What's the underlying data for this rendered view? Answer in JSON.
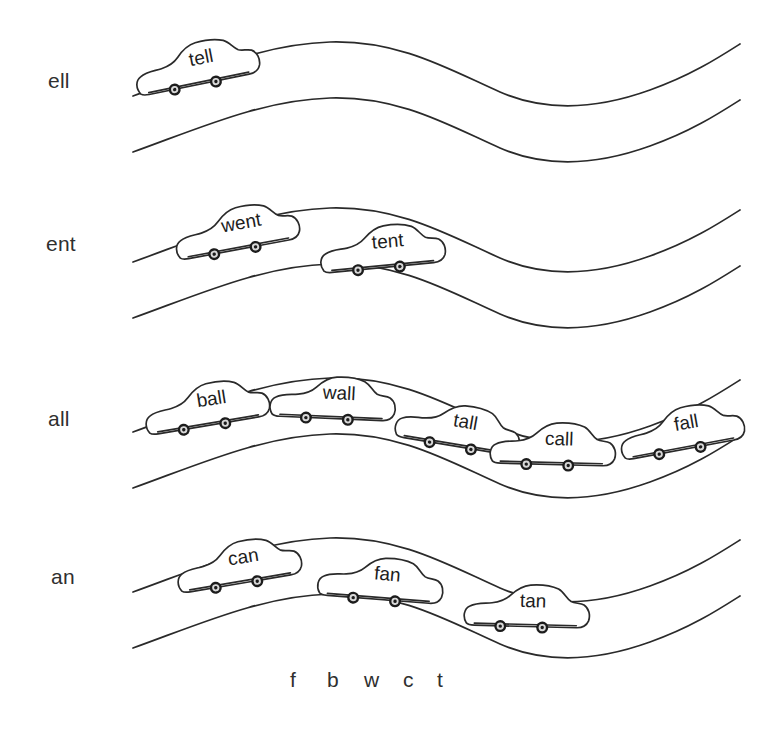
{
  "page": {
    "width": 767,
    "height": 729,
    "background_color": "#ffffff",
    "ink_color": "#2a2a2a",
    "text_color": "#2f2f2f"
  },
  "rows": [
    {
      "id": "row-ell",
      "rime_label": "ell",
      "label_x": 48,
      "label_y": 82,
      "baseline_y": 78,
      "cars": [
        {
          "word": "tell",
          "x": 196,
          "y": 63,
          "rotation": -11
        }
      ]
    },
    {
      "id": "row-ent",
      "rime_label": "ent",
      "label_x": 46,
      "label_y": 245,
      "baseline_y": 241,
      "cars": [
        {
          "word": "went",
          "x": 236,
          "y": 228,
          "rotation": -10
        },
        {
          "word": "tent",
          "x": 382,
          "y": 246,
          "rotation": -5
        }
      ]
    },
    {
      "id": "row-all",
      "rime_label": "all",
      "label_x": 48,
      "label_y": 420,
      "baseline_y": 416,
      "cars": [
        {
          "word": "ball",
          "x": 206,
          "y": 404,
          "rotation": -9
        },
        {
          "word": "wall",
          "x": 333,
          "y": 397,
          "rotation": 3
        },
        {
          "word": "tall",
          "x": 459,
          "y": 425,
          "rotation": 10
        },
        {
          "word": "call",
          "x": 553,
          "y": 443,
          "rotation": 2
        },
        {
          "word": "fall",
          "x": 681,
          "y": 428,
          "rotation": -10
        }
      ]
    },
    {
      "id": "row-an",
      "rime_label": "an",
      "label_x": 51,
      "label_y": 578,
      "baseline_y": 574,
      "cars": [
        {
          "word": "can",
          "x": 238,
          "y": 562,
          "rotation": -9
        },
        {
          "word": "fan",
          "x": 381,
          "y": 578,
          "rotation": 5
        },
        {
          "word": "tan",
          "x": 527,
          "y": 605,
          "rotation": 2
        }
      ]
    }
  ],
  "onsets": {
    "letters": [
      {
        "char": "f",
        "x": 290
      },
      {
        "char": "b",
        "x": 327
      },
      {
        "char": "w",
        "x": 364
      },
      {
        "char": "c",
        "x": 403
      },
      {
        "char": "t",
        "x": 437
      }
    ],
    "y": 686
  },
  "road": {
    "start_x": 133,
    "end_x": 740,
    "lane_gap": 56,
    "row_tops": [
      42,
      208,
      378,
      538
    ],
    "curve_description": "S-curve: rises to a crest near x=330, dips to a trough near x=560, then rises toward the right edge"
  }
}
